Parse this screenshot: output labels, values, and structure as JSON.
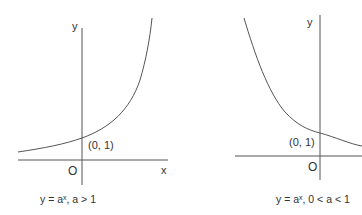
{
  "graphs": [
    {
      "id": "growth",
      "y_axis_label": "y",
      "x_axis_label": "x",
      "origin_label": "O",
      "point_label": "(0, 1)",
      "caption": "y = aˣ,  a > 1",
      "curve": "increasing exponential"
    },
    {
      "id": "decay",
      "y_axis_label": "y",
      "origin_label": "O",
      "point_label": "(0, 1)",
      "caption": "y = aˣ,  0 < a < 1",
      "curve": "decreasing exponential"
    }
  ],
  "colors": {
    "line": "#555555",
    "text": "#333333"
  }
}
